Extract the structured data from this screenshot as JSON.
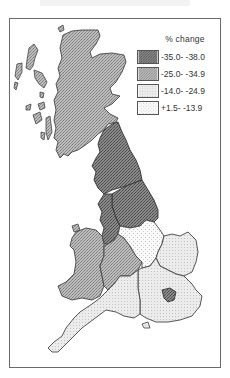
{
  "map": {
    "type": "choropleth",
    "area": "Great Britain standard regions",
    "frame": true
  },
  "legend": {
    "title": "% change",
    "items": [
      {
        "label": "-35.0- -38.0",
        "class": "class1",
        "color": "#7d7d7d",
        "pattern": "dense-crosshatch"
      },
      {
        "label": "-25.0- -34.9",
        "class": "class2",
        "color": "#b2b2b2",
        "pattern": "medium-dots"
      },
      {
        "label": "-14.0- -24.9",
        "class": "class3",
        "color": "#e9e9e9",
        "pattern": "light-dots"
      },
      {
        "label": "+1.5- -13.9",
        "class": "class4",
        "color": "#f7f7f7",
        "pattern": "sparse-dots"
      }
    ]
  },
  "regions": [
    {
      "name": "Scotland",
      "class": "class2"
    },
    {
      "name": "North",
      "class": "class1"
    },
    {
      "name": "North West",
      "class": "class1"
    },
    {
      "name": "Yorkshire and Humberside",
      "class": "class1"
    },
    {
      "name": "Wales",
      "class": "class2"
    },
    {
      "name": "West Midlands",
      "class": "class2"
    },
    {
      "name": "East Midlands",
      "class": "class4"
    },
    {
      "name": "East Anglia",
      "class": "class3"
    },
    {
      "name": "South East",
      "class": "class3"
    },
    {
      "name": "Greater London",
      "class": "class1"
    },
    {
      "name": "South West",
      "class": "class3"
    }
  ]
}
